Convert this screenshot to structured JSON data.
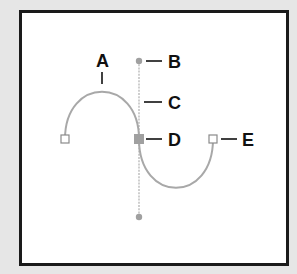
{
  "diagram": {
    "colors": {
      "background": "#e6e6e6",
      "frame_fill": "#ffffff",
      "frame_border": "#1a1a1a",
      "curve": "#a8a8a8",
      "handle_line": "#b0b0b0",
      "handle_point": "#9e9e9e",
      "selected_anchor": "#9e9e9e",
      "unselected_anchor_fill": "#ffffff",
      "unselected_anchor_stroke": "#8a8a8a",
      "callout": "#111111",
      "label_text": "#111111"
    },
    "labels": {
      "a": "A",
      "b": "B",
      "c": "C",
      "d": "D",
      "e": "E"
    },
    "callouts": [
      {
        "id": "A",
        "meaning": "curved segment"
      },
      {
        "id": "B",
        "meaning": "direction point"
      },
      {
        "id": "C",
        "meaning": "direction line"
      },
      {
        "id": "D",
        "meaning": "selected anchor point"
      },
      {
        "id": "E",
        "meaning": "unselected anchor point"
      }
    ],
    "points": {
      "left_anchor": [
        65,
        139
      ],
      "center_anchor": [
        139,
        139
      ],
      "right_anchor": [
        213,
        139
      ],
      "top_handle": [
        139,
        61
      ],
      "bottom_handle": [
        139,
        217
      ]
    }
  }
}
